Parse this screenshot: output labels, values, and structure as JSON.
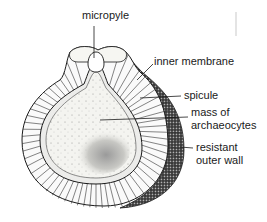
{
  "diagram": {
    "labels": [
      {
        "id": "micropyle",
        "lines": [
          "micropyle"
        ],
        "x": 82,
        "y": 9
      },
      {
        "id": "inner-membrane",
        "lines": [
          "inner membrane"
        ],
        "x": 154,
        "y": 55
      },
      {
        "id": "spicule",
        "lines": [
          "spicule"
        ],
        "x": 184,
        "y": 89
      },
      {
        "id": "mass-of-archaeocytes",
        "lines": [
          "mass of",
          "archaeocytes"
        ],
        "x": 191,
        "y": 106
      },
      {
        "id": "resistant-outer-wall",
        "lines": [
          "resistant",
          "outer wall"
        ],
        "x": 196,
        "y": 141
      }
    ],
    "colors": {
      "ink": "#1a1a1a",
      "stipple_dark": "#2a2a2a",
      "interior": "#f2f2ee",
      "background": "#ffffff"
    }
  }
}
